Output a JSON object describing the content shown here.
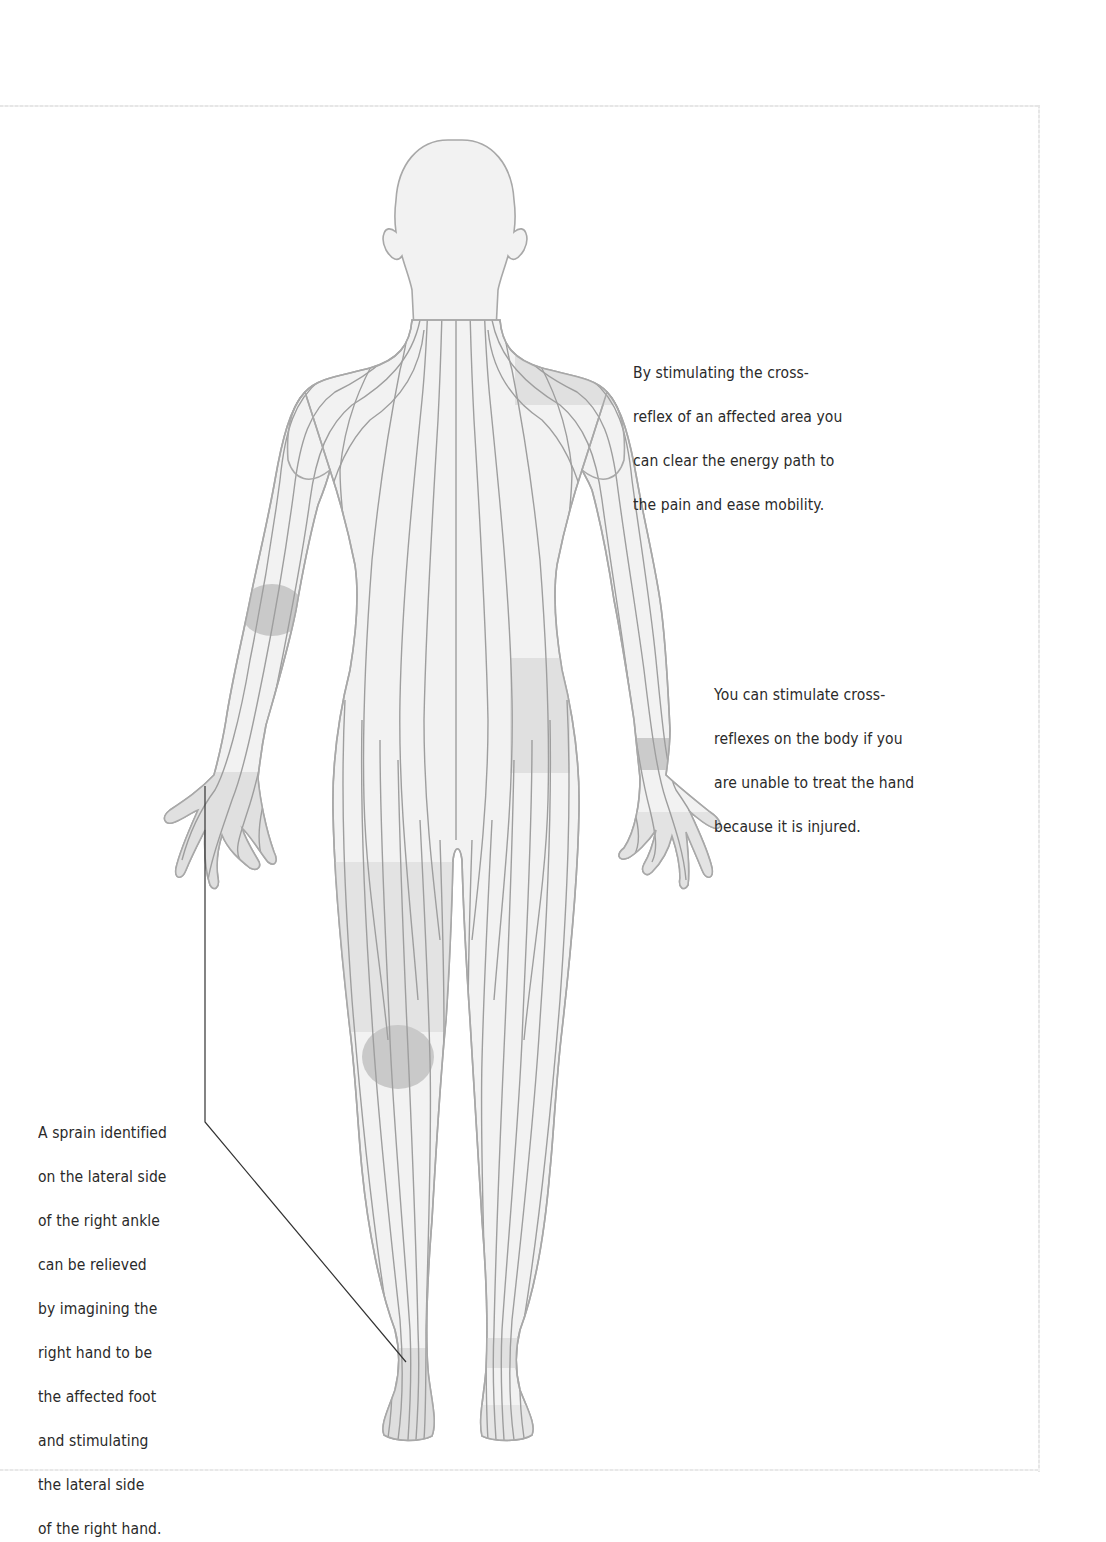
{
  "figure": {
    "colors": {
      "background": "#ffffff",
      "body_fill": "#f2f2f2",
      "body_outline": "#a8a8a8",
      "energy_line": "#9e9e9e",
      "highlight_light": "#e0e0e0",
      "highlight_dark": "#c9c9c9",
      "callout_line": "#333333",
      "text": "#2a2a2a",
      "frame": "#e6e6e6"
    },
    "highlighted_areas": [
      {
        "name": "left-shoulder",
        "shade": "light"
      },
      {
        "name": "right-elbow",
        "shade": "dark"
      },
      {
        "name": "right-hand",
        "shade": "light"
      },
      {
        "name": "left-hip",
        "shade": "light"
      },
      {
        "name": "left-wrist",
        "shade": "dark"
      },
      {
        "name": "left-hand",
        "shade": "light"
      },
      {
        "name": "right-thigh",
        "shade": "light"
      },
      {
        "name": "right-knee",
        "shade": "dark"
      },
      {
        "name": "right-ankle",
        "shade": "light"
      },
      {
        "name": "left-ankle",
        "shade": "light"
      }
    ]
  },
  "captions": {
    "shoulder": {
      "lines": [
        "By stimulating the cross-",
        "reflex of an affected area you",
        "can clear the energy path to",
        "the pain and ease mobility."
      ]
    },
    "hand": {
      "lines": [
        "You can stimulate cross-",
        "reflexes on the body if you",
        "are unable to treat the hand",
        "because it is injured."
      ]
    },
    "ankle": {
      "lines": [
        "A sprain identified",
        "on the lateral side",
        "of the right ankle",
        "can be relieved",
        "by imagining the",
        "right hand to be",
        "the affected foot",
        "and stimulating",
        "the lateral side",
        "of the right hand."
      ]
    }
  }
}
